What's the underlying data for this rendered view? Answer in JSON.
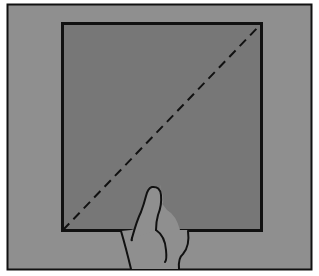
{
  "diagram": {
    "colors": {
      "background": "#ffffff",
      "outer_panel": "#8f8f8f",
      "square": "#777777",
      "hand": "#8f8f8f",
      "outline": "#111111"
    },
    "elements": [
      {
        "name": "outer-frame",
        "type": "rectangle"
      },
      {
        "name": "square-sheet",
        "type": "rectangle"
      },
      {
        "name": "diagonal-fold-line",
        "type": "dashed-line",
        "from": "bottom-left",
        "to": "top-right"
      },
      {
        "name": "hand",
        "type": "illustration",
        "position": "bottom-center"
      }
    ]
  }
}
